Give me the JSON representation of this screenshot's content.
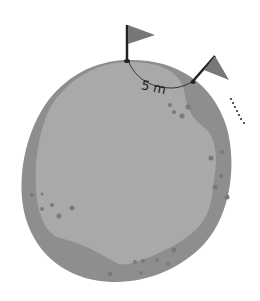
{
  "diagram": {
    "distance_label": "5 m",
    "colors": {
      "outer_shell": "#8e8e8e",
      "inner_region": "#a9a9a9",
      "craters": "#7a7a7a",
      "flag": "#777777",
      "pole": "#222222",
      "arc": "#333333",
      "dots": "#222222"
    }
  }
}
